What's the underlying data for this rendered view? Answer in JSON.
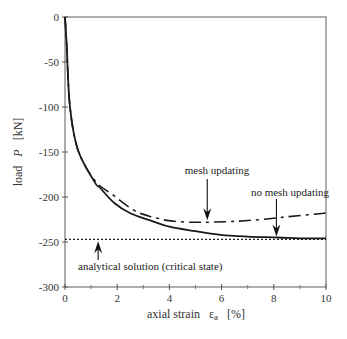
{
  "chart_data": {
    "type": "line",
    "title": "",
    "xlabel": "axial strain  ε_a  [%]",
    "xlabel_parts": {
      "pre": "axial strain",
      "symbol": "ε",
      "sub": "a",
      "unit": "[%]"
    },
    "ylabel": "load  P  [kN]",
    "ylabel_parts": {
      "pre": "load",
      "symbol": "P",
      "unit": "[kN]"
    },
    "xlim": [
      0,
      10
    ],
    "ylim": [
      -300,
      0
    ],
    "xticks": [
      0,
      2,
      4,
      6,
      8,
      10
    ],
    "xticks_minor": [
      1,
      3,
      5,
      7,
      9
    ],
    "yticks": [
      0,
      -50,
      -100,
      -150,
      -200,
      -250,
      -300
    ],
    "grid": false,
    "legend": "none (inline annotations)",
    "series": [
      {
        "name": "no mesh updating",
        "style": "solid",
        "x": [
          0,
          0.06,
          0.19,
          0.5,
          1.15,
          1.35,
          1.9,
          2.5,
          3.27,
          4.0,
          5.0,
          5.96,
          7.0,
          8.15,
          9.0,
          10.0
        ],
        "y": [
          0,
          -29,
          -100,
          -148,
          -184,
          -190,
          -207,
          -218,
          -226,
          -233,
          -238,
          -242,
          -244,
          -245,
          -246,
          -246
        ]
      },
      {
        "name": "mesh updating",
        "style": "dash-dot",
        "x": [
          0,
          0.06,
          0.19,
          0.5,
          1.15,
          1.85,
          2.6,
          3.2,
          3.9,
          4.7,
          5.2,
          5.5,
          6.5,
          7.5,
          8.5,
          9.9,
          10.0
        ],
        "y": [
          0,
          -29,
          -100,
          -148,
          -182,
          -198,
          -214,
          -221,
          -226,
          -228,
          -228,
          -228,
          -227,
          -225,
          -222,
          -218,
          -217
        ]
      },
      {
        "name": "analytical solution (critical state)",
        "style": "dotted",
        "x": [
          0,
          10
        ],
        "y": [
          -247,
          -247
        ]
      }
    ],
    "annotations": [
      {
        "text": "mesh updating",
        "arrow_to": [
          5.45,
          -227
        ]
      },
      {
        "text": "no mesh updating",
        "arrow_to": [
          8.1,
          -245
        ]
      },
      {
        "text": "analytical solution (critical state)",
        "arrow_to": [
          1.27,
          -247
        ]
      }
    ]
  }
}
